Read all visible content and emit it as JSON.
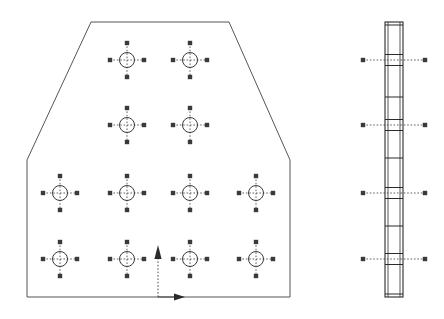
{
  "drawing": {
    "title": "Perforated Plate — Front and Side View",
    "type": "engineering-drawing",
    "background_color": "#ffffff",
    "line_color": "#3a3a3a",
    "outline_color": "#555555",
    "canvas": {
      "width": 444,
      "height": 319
    }
  },
  "front_view": {
    "name": "front-view",
    "outline": {
      "name": "plate-outline",
      "shape": "chamfered-rectangle",
      "points": "91,22 229,22 290,160 290,297 27,297 27,160",
      "vertices": [
        {
          "x": 91,
          "y": 22,
          "label": "top-left-chamfer"
        },
        {
          "x": 229,
          "y": 22,
          "label": "top-right-chamfer"
        },
        {
          "x": 290,
          "y": 160,
          "label": "right-shoulder"
        },
        {
          "x": 290,
          "y": 297,
          "label": "bottom-right"
        },
        {
          "x": 27,
          "y": 297,
          "label": "bottom-left"
        },
        {
          "x": 27,
          "y": 160,
          "label": "left-shoulder"
        }
      ]
    },
    "hole_symbol": {
      "circle_radius": 7.5,
      "centerline_half_length": 17,
      "tick_size": 2.2,
      "style": "circle-with-crosshair-centerlines"
    },
    "hole_rows": [
      {
        "row": 1,
        "y": 60,
        "x_positions": [
          127,
          190
        ]
      },
      {
        "row": 2,
        "y": 125,
        "x_positions": [
          127,
          190
        ]
      },
      {
        "row": 3,
        "y": 193,
        "x_positions": [
          60,
          127,
          190,
          256
        ]
      },
      {
        "row": 4,
        "y": 259,
        "x_positions": [
          60,
          127,
          190,
          256
        ]
      }
    ],
    "hole_count": 12,
    "datum": {
      "name": "origin-datum",
      "x": 158,
      "y": 297,
      "vertical_arrow": {
        "from_y": 297,
        "to_y": 245,
        "direction": "up"
      },
      "horizontal_arrow": {
        "from_x": 158,
        "to_x": 185,
        "direction": "right"
      }
    }
  },
  "side_view": {
    "name": "side-view",
    "plate": {
      "x": 385,
      "y": 22,
      "width": 18,
      "height": 275
    },
    "inner_offset": 3,
    "hole_marks": [
      {
        "y": 60,
        "extend_left": 22,
        "extend_right": 22,
        "band_height": 11
      },
      {
        "y": 125,
        "extend_left": 22,
        "extend_right": 22,
        "band_height": 11
      },
      {
        "y": 193,
        "extend_left": 22,
        "extend_right": 22,
        "band_height": 11
      },
      {
        "y": 259,
        "extend_left": 22,
        "extend_right": 22,
        "band_height": 11
      }
    ],
    "intermediate_marks": [
      {
        "y": 97
      },
      {
        "y": 158
      },
      {
        "y": 226
      }
    ]
  }
}
